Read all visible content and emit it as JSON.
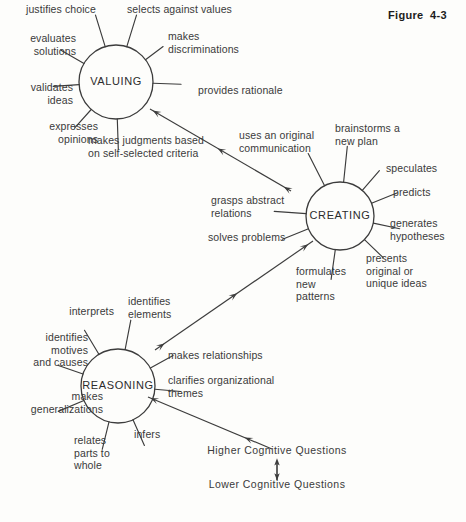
{
  "figure": {
    "caption": "Figure  4-3"
  },
  "nodes": [
    {
      "id": "valuing",
      "label": "VALUING",
      "cx": 116,
      "cy": 82,
      "r": 37
    },
    {
      "id": "creating",
      "label": "CREATING",
      "cx": 340,
      "cy": 216,
      "r": 34
    },
    {
      "id": "reasoning",
      "label": "REASONING",
      "cx": 118,
      "cy": 386,
      "r": 37
    }
  ],
  "valuing_spokes": [
    {
      "label": "justifies choice",
      "x": 26,
      "y": 3,
      "w": 100,
      "align": "left",
      "angle": 253,
      "len": 33
    },
    {
      "label": "selects against values",
      "x": 127,
      "y": 3,
      "w": 130,
      "align": "left",
      "angle": 287,
      "len": 33
    },
    {
      "label": "makes\ndiscriminations",
      "x": 168,
      "y": 30,
      "w": 105,
      "align": "left",
      "angle": 323,
      "len": 22
    },
    {
      "label": "provides rationale",
      "x": 198,
      "y": 84,
      "w": 110,
      "align": "left",
      "angle": 2,
      "len": 28
    },
    {
      "label": "makes judgments based\non self-selected criteria",
      "x": 88,
      "y": 134,
      "w": 150,
      "align": "left",
      "angle": 88,
      "len": 30
    },
    {
      "label": "expresses\nopinions",
      "x": 28,
      "y": 120,
      "w": 70,
      "align": "right",
      "angle": 132,
      "len": 25
    },
    {
      "label": "validates\nideas",
      "x": 13,
      "y": 81,
      "w": 60,
      "align": "right",
      "angle": 176,
      "len": 26
    },
    {
      "label": "evaluates\nsolutions",
      "x": 13,
      "y": 32,
      "w": 63,
      "align": "right",
      "angle": 210,
      "len": 27
    }
  ],
  "creating_spokes": [
    {
      "label": "brainstorms a\nnew plan",
      "x": 335,
      "y": 122,
      "w": 86,
      "align": "left",
      "angle": 276,
      "len": 36
    },
    {
      "label": "speculates",
      "x": 386,
      "y": 162,
      "w": 70,
      "align": "left",
      "angle": 311,
      "len": 26
    },
    {
      "label": "predicts",
      "x": 393,
      "y": 186,
      "w": 60,
      "align": "left",
      "angle": 338,
      "len": 28
    },
    {
      "label": "generates\nhypotheses",
      "x": 390,
      "y": 217,
      "w": 76,
      "align": "left",
      "angle": 12,
      "len": 27
    },
    {
      "label": "presents\noriginal or\nunique ideas",
      "x": 366,
      "y": 252,
      "w": 90,
      "align": "left",
      "angle": 44,
      "len": 26
    },
    {
      "label": "formulates\nnew\npatterns",
      "x": 296,
      "y": 265,
      "w": 64,
      "align": "left",
      "angle": 98,
      "len": 30
    },
    {
      "label": "solves problems",
      "x": 208,
      "y": 231,
      "w": 95,
      "align": "left",
      "angle": 158,
      "len": 28
    },
    {
      "label": "grasps abstract\nrelations",
      "x": 211,
      "y": 194,
      "w": 92,
      "align": "left",
      "angle": 184,
      "len": 32
    },
    {
      "label": "uses an original\ncommunication",
      "x": 239,
      "y": 129,
      "w": 100,
      "align": "left",
      "angle": 243,
      "len": 36
    }
  ],
  "reasoning_spokes": [
    {
      "label": "identifies\nelements",
      "x": 128,
      "y": 295,
      "w": 66,
      "align": "left",
      "angle": 281,
      "len": 30
    },
    {
      "label": "makes relationships",
      "x": 168,
      "y": 349,
      "w": 118,
      "align": "left",
      "angle": 331,
      "len": 26
    },
    {
      "label": "clarifies organizational\nthemes",
      "x": 168,
      "y": 374,
      "w": 130,
      "align": "left",
      "angle": 5,
      "len": 26
    },
    {
      "label": "infers",
      "x": 134,
      "y": 428,
      "w": 42,
      "align": "left",
      "angle": 66,
      "len": 28
    },
    {
      "label": "relates\nparts to\nwhole",
      "x": 74,
      "y": 434,
      "w": 52,
      "align": "left",
      "angle": 104,
      "len": 28
    },
    {
      "label": "makes\ngeneralizations",
      "x": 11,
      "y": 390,
      "w": 92,
      "align": "right",
      "angle": 157,
      "len": 28
    },
    {
      "label": "identifies\nmotives\nand causes",
      "x": 14,
      "y": 331,
      "w": 74,
      "align": "right",
      "angle": 199,
      "len": 26
    },
    {
      "label": "interprets",
      "x": 48,
      "y": 305,
      "w": 66,
      "align": "right",
      "angle": 239,
      "len": 28
    }
  ],
  "connections": [
    {
      "id": "creating-to-valuing",
      "from": "creating",
      "to": "valuing",
      "x1": 291,
      "y1": 191,
      "x2": 150,
      "y2": 109,
      "arrowheads": [
        0.05,
        0.52,
        0.98
      ]
    },
    {
      "id": "reasoning-to-creating",
      "from": "reasoning",
      "to": "creating",
      "x1": 155,
      "y1": 350,
      "x2": 313,
      "y2": 241,
      "arrowheads": [
        0.06,
        0.52,
        0.97
      ]
    },
    {
      "id": "questions-to-reasoning",
      "from": "higher-cognitive-questions",
      "to": "reasoning",
      "x1": 272,
      "y1": 449,
      "x2": 148,
      "y2": 397,
      "arrowheads": [
        0.22,
        0.98
      ]
    }
  ],
  "axis": {
    "higher_label": "Higher Cognitive Questions",
    "lower_label": "Lower Cognitive Questions",
    "higher_x": 277,
    "higher_y": 450,
    "lower_x": 277,
    "lower_y": 484,
    "arrow_x": 277,
    "arrow_y1": 464,
    "arrow_y2": 480
  },
  "colors": {
    "stroke": "#3c3c3c",
    "text": "#3a3a3a",
    "node_text": "#2c2c2c",
    "title": "#1c1c1c",
    "background": "#fdfdfb"
  }
}
